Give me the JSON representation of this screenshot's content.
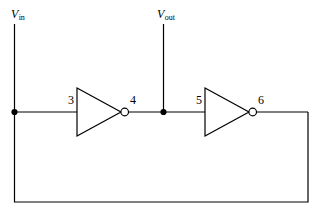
{
  "figure": {
    "background_color": "#ffffff",
    "line_color": "#000000"
  },
  "labels": {
    "vin": {
      "symbol": "V",
      "subscript": "in"
    },
    "vout": {
      "symbol": "V",
      "subscript": "out"
    },
    "node3": "3",
    "node4": "4",
    "node5": "5",
    "node6": "6"
  },
  "components": [
    {
      "name": "inverter-1",
      "type": "inverter",
      "input_node": "3",
      "output_node": "4"
    },
    {
      "name": "inverter-2",
      "type": "inverter",
      "input_node": "5",
      "output_node": "6"
    }
  ],
  "nodes": [
    {
      "name": "vin-junction",
      "label": "V-in",
      "junction_dot": true
    },
    {
      "name": "vout-junction",
      "label": "V-out",
      "junction_dot": true
    }
  ],
  "wires": [
    {
      "name": "vin-stub",
      "orientation": "vertical"
    },
    {
      "name": "vout-stub",
      "orientation": "vertical"
    },
    {
      "name": "input-wire",
      "orientation": "horizontal"
    },
    {
      "name": "interstage-wire",
      "orientation": "horizontal"
    },
    {
      "name": "output-wire",
      "orientation": "horizontal"
    },
    {
      "name": "feedback-right",
      "orientation": "vertical"
    },
    {
      "name": "feedback-bottom",
      "orientation": "horizontal"
    },
    {
      "name": "feedback-left",
      "orientation": "vertical"
    }
  ]
}
